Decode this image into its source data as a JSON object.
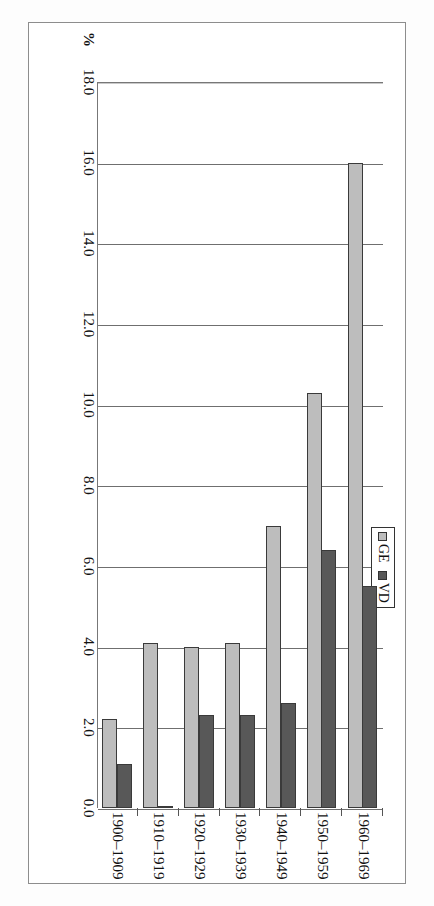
{
  "figure": {
    "orientation": "rotated-90",
    "axis_unit_label": "%",
    "legend": {
      "items": [
        {
          "key": "GE",
          "label": "GE",
          "color": "#bdbdbd"
        },
        {
          "key": "VD",
          "label": "VD",
          "color": "#585858"
        }
      ]
    }
  },
  "chart_data": {
    "type": "bar",
    "title": "",
    "xlabel": "",
    "ylabel": "%",
    "orientation": "horizontal",
    "categories": [
      "1900–1909",
      "1910–1919",
      "1920–1929",
      "1930–1939",
      "1940–1949",
      "1950–1959",
      "1960–1969"
    ],
    "series": [
      {
        "name": "GE",
        "color": "#bdbdbd",
        "values": [
          2.2,
          4.1,
          4.0,
          4.1,
          7.0,
          10.3,
          16.0
        ]
      },
      {
        "name": "VD",
        "color": "#585858",
        "values": [
          1.1,
          0.0,
          2.3,
          2.3,
          2.6,
          6.4,
          5.5
        ]
      }
    ],
    "ticks": [
      "0.0",
      "2.0",
      "4.0",
      "6.0",
      "8.0",
      "10.0",
      "12.0",
      "14.0",
      "16.0",
      "18.0"
    ],
    "tick_values": [
      0.0,
      2.0,
      4.0,
      6.0,
      8.0,
      10.0,
      12.0,
      14.0,
      16.0,
      18.0
    ],
    "ylim": [
      0.0,
      18.0
    ],
    "grid": true,
    "legend_position": "top-center"
  }
}
